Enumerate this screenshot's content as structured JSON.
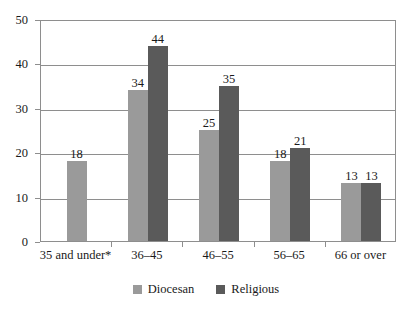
{
  "chart_data": {
    "type": "bar",
    "title": "",
    "subtitle": "",
    "xlabel": "",
    "ylabel": "",
    "ylim": [
      0,
      50
    ],
    "y_ticks": [
      0,
      10,
      20,
      30,
      40,
      50
    ],
    "grid": true,
    "legend_position": "bottom-center",
    "categories": [
      "35 and under*",
      "36–45",
      "46–55",
      "56–65",
      "66 or over"
    ],
    "series": [
      {
        "name": "Diocesan",
        "color": "#9a9a9a",
        "values": [
          18,
          34,
          25,
          18,
          13
        ]
      },
      {
        "name": "Religious",
        "color": "#5a5a5a",
        "values": [
          null,
          44,
          35,
          21,
          13
        ]
      }
    ],
    "data_labels": {
      "Diocesan": [
        "18",
        "34",
        "25",
        "18",
        "13"
      ],
      "Religious": [
        "",
        "44",
        "35",
        "21",
        "13"
      ]
    },
    "y_tick_labels": [
      "0",
      "10",
      "20",
      "30",
      "40",
      "50"
    ],
    "annotations": [
      "* category 35 and under has no Religious bar"
    ]
  },
  "legend": {
    "items": [
      {
        "label": "Diocesan",
        "color": "#9a9a9a"
      },
      {
        "label": "Religious",
        "color": "#5a5a5a"
      }
    ]
  },
  "colors": {
    "diocesan": "#9a9a9a",
    "religious": "#5a5a5a",
    "axis": "#8e8e8e",
    "text": "#1a1a1a",
    "background": "#ffffff"
  }
}
